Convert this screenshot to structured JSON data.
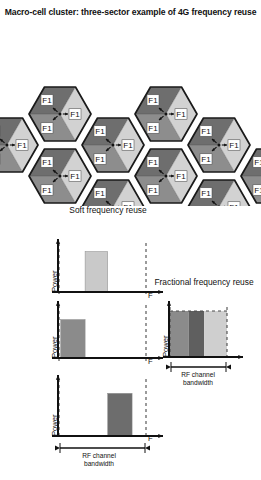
{
  "title": "Macro-cell cluster: three-sector example of 4G frequency reuse",
  "cells": {
    "sector_label": "F1",
    "count": 10,
    "sectors_per_cell": 3,
    "colors": {
      "dark": "#6e6e6e",
      "medium": "#8d8d8d",
      "light": "#d2d2d2",
      "outline": "#1a1a1a"
    },
    "items": [
      {
        "id": "cell-1",
        "cx": 60,
        "cy": 78
      },
      {
        "id": "cell-2",
        "cx": 60,
        "cy": 140
      },
      {
        "id": "cell-3",
        "cx": 113,
        "cy": 109
      },
      {
        "id": "cell-4",
        "cx": 113,
        "cy": 171
      },
      {
        "id": "cell-5",
        "cx": 166,
        "cy": 78
      },
      {
        "id": "cell-6",
        "cx": 166,
        "cy": 140
      },
      {
        "id": "cell-7",
        "cx": 219,
        "cy": 109
      },
      {
        "id": "cell-8",
        "cx": 219,
        "cy": 171
      },
      {
        "id": "cell-9",
        "cx": 7,
        "cy": 109
      },
      {
        "id": "cell-10",
        "cx": 272,
        "cy": 140
      }
    ]
  },
  "soft": {
    "caption": "Soft frequency reuse",
    "axis_y": "Power",
    "axis_x": "F",
    "bandwidth_label_line1": "RF channel",
    "bandwidth_label_line2": "bandwidth",
    "charts": [
      {
        "id": "soft-chart-1",
        "bar_color": "#c9c9c9",
        "bar_x_frac": 0.3,
        "bar_w_frac": 0.26,
        "bar_h_frac": 0.92
      },
      {
        "id": "soft-chart-2",
        "bar_color": "#8b8b8b",
        "bar_x_frac": 0.02,
        "bar_w_frac": 0.28,
        "bar_h_frac": 0.8
      },
      {
        "id": "soft-chart-3",
        "bar_color": "#6d6d6d",
        "bar_x_frac": 0.56,
        "bar_w_frac": 0.28,
        "bar_h_frac": 0.82
      }
    ]
  },
  "fractional": {
    "caption": "Fractional frequency reuse",
    "axis_y": "Power",
    "axis_x": "",
    "bandwidth_label_line1": "RF channel",
    "bandwidth_label_line2": "bandwidth",
    "bands": [
      {
        "id": "frac-band-1",
        "color": "#8b8b8b",
        "width_frac": 0.33
      },
      {
        "id": "frac-band-2",
        "color": "#5f5f5f",
        "width_frac": 0.27
      },
      {
        "id": "frac-band-3",
        "color": "#cfcfcf",
        "width_frac": 0.4
      }
    ]
  }
}
